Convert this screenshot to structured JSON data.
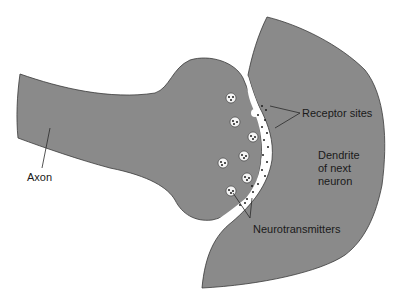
{
  "diagram": {
    "colors": {
      "tissue": "#8a8a8a",
      "outline": "#3a3a3a",
      "cleft": "#ffffff",
      "label": "#1a1a1a"
    },
    "labels": {
      "axon": "Axon",
      "receptor_sites": "Receptor sites",
      "dendrite_line1": "Dendrite",
      "dendrite_line2": "of next",
      "dendrite_line3": "neuron",
      "neurotransmitters": "Neurotransmitters"
    }
  }
}
